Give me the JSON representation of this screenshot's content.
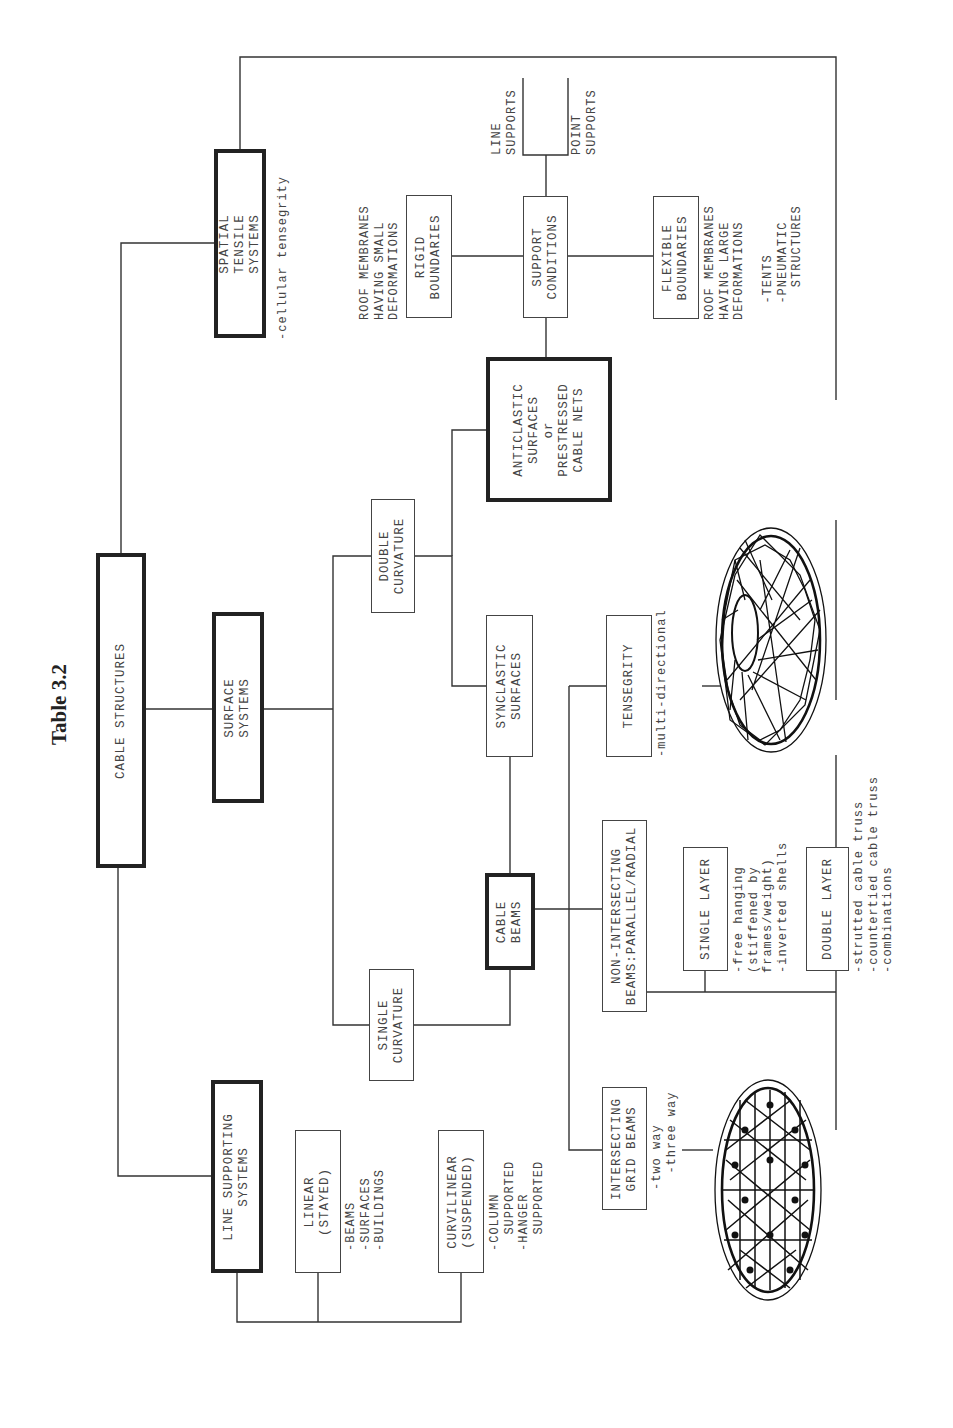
{
  "title": "Table 3.2",
  "nodes": {
    "root": "CABLE STRUCTURES",
    "line_supporting": "LINE SUPPORTING\nSYSTEMS",
    "surface_systems": "SURFACE\nSYSTEMS",
    "spatial_tensile": "SPATIAL\nTENSILE\nSYSTEMS",
    "linear": "LINEAR\n(STAYED)",
    "curvilinear": "CURVILINEAR\n(SUSPENDED)",
    "single_curvature": "SINGLE\nCURVATURE",
    "double_curvature": "DOUBLE\nCURVATURE",
    "cable_beams": "CABLE\nBEAMS",
    "synclastic": "SYNCLASTIC\nSURFACES",
    "anticlastic": "ANTICLASTIC\nSURFACES\nor\nPRESTRESSED\nCABLE NETS",
    "rigid": "RIGID\nBOUNDARIES",
    "support_conditions": "SUPPORT\nCONDITIONS",
    "flexible": "FLEXIBLE\nBOUNDARIES",
    "tensegrity": "TENSEGRITY",
    "non_intersecting": "NON-INTERSECTING\nBEAMS:PARALLEL/RADIAL",
    "single_layer": "SINGLE LAYER",
    "double_layer": "DOUBLE LAYER",
    "intersecting": "INTERSECTING\nGRID BEAMS"
  },
  "notes": {
    "spatial": "-cellular tensegrity",
    "rigid": "ROOF MEMBRANES\nHAVING SMALL\nDEFORMATIONS",
    "line_supports": "LINE\nSUPPORTS",
    "point_supports": "POINT\nSUPPORTS",
    "flexible": "ROOF MEMBRANES\nHAVING LARGE\nDEFORMATIONS\n\n  -TENTS\n  -PNEUMATIC\n    STRUCTURES",
    "linear": "-BEAMS\n-SURFACES\n-BUILDINGS",
    "curvilinear": "-COLUMN\n  SUPPORTED\n-HANGER\n  SUPPORTED",
    "tensegrity": "-multi-directional",
    "single_layer": "-free hanging\n(stiffened by\nframes/weight)\n-inverted shells",
    "double_layer": "-strutted cable truss\n-countertied cable truss\n-combinations",
    "intersecting": "-two way\n  -three way"
  },
  "illustrations": {
    "tensegrity_dome": "tensegrity-dome-plan",
    "grid_net": "intersecting-grid-net-plan"
  }
}
